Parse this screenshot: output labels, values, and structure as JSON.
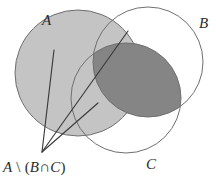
{
  "diagram": {
    "type": "venn-3-set",
    "background_color": "#ffffff",
    "stroke_color": "#6b6b6b",
    "text_color": "#2b2b2b",
    "sets": [
      {
        "id": "A",
        "label": "A",
        "label_x": 42,
        "label_y": 13,
        "cx": 78,
        "cy": 73,
        "r": 63,
        "fill": "#c4c4c4",
        "filled": true
      },
      {
        "id": "B",
        "label": "B",
        "label_x": 199,
        "label_y": 16,
        "cx": 148,
        "cy": 62,
        "r": 55,
        "fill": "none",
        "filled": false
      },
      {
        "id": "C",
        "label": "C",
        "label_x": 146,
        "label_y": 157,
        "cx": 126,
        "cy": 98,
        "r": 55,
        "fill": "none",
        "filled": false
      }
    ],
    "shaded_regions": [
      {
        "name": "A-only",
        "fill": "#c4c4c4"
      },
      {
        "name": "B-intersect-C",
        "fill": "#858585"
      }
    ],
    "annotation": {
      "expression_parts": {
        "set_a": "A",
        "setminus": " \\ ",
        "open_paren": "(",
        "set_b": "B",
        "intersect": "∩",
        "set_c": "C",
        "close_paren": ")"
      },
      "expression_full": "A \\ (B∩C)",
      "vertex_x": 42,
      "vertex_y": 152,
      "leaders": [
        {
          "x2": 54,
          "y2": 50
        },
        {
          "x2": 128,
          "y2": 31
        },
        {
          "x2": 98,
          "y2": 103
        }
      ]
    }
  }
}
